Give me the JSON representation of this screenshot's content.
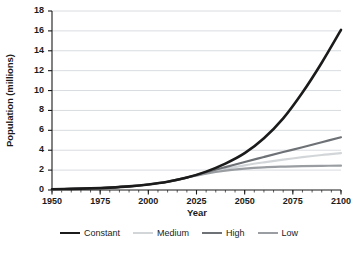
{
  "chart_data": {
    "type": "line",
    "title": "",
    "xlabel": "Year",
    "ylabel": "Population (millions)",
    "xlim": [
      1950,
      2100
    ],
    "ylim": [
      0,
      18
    ],
    "xticks": [
      1950,
      1975,
      2000,
      2025,
      2050,
      2075,
      2100
    ],
    "xtick_labels": [
      "1950",
      "1975",
      "2000",
      "2025",
      "2050",
      "2075",
      "2100"
    ],
    "x_minor_tick_step": 5,
    "yticks": [
      0,
      2,
      4,
      6,
      8,
      10,
      12,
      14,
      16,
      18
    ],
    "ytick_labels": [
      "0",
      "2",
      "4",
      "6",
      "8",
      "10",
      "12",
      "14",
      "16",
      "18"
    ],
    "grid": "horizontal",
    "grid_color": "#d8dce0",
    "legend_position": "below",
    "x": [
      1950,
      1960,
      1970,
      1980,
      1990,
      2000,
      2010,
      2020,
      2030,
      2040,
      2050,
      2060,
      2070,
      2080,
      2090,
      2100
    ],
    "series": [
      {
        "name": "Constant",
        "color": "#1b1b1b",
        "width": 2.6,
        "values": [
          0.08,
          0.11,
          0.16,
          0.24,
          0.36,
          0.55,
          0.83,
          1.25,
          1.85,
          2.65,
          3.7,
          5.2,
          7.2,
          9.8,
          12.8,
          16.1
        ]
      },
      {
        "name": "Medium",
        "color": "#d3d6d9",
        "width": 2.2,
        "values": [
          0.08,
          0.11,
          0.16,
          0.24,
          0.36,
          0.55,
          0.83,
          1.25,
          1.72,
          2.12,
          2.48,
          2.78,
          3.05,
          3.3,
          3.52,
          3.7
        ]
      },
      {
        "name": "High",
        "color": "#6e7276",
        "width": 2.2,
        "values": [
          0.08,
          0.11,
          0.16,
          0.24,
          0.36,
          0.55,
          0.83,
          1.25,
          1.78,
          2.3,
          2.82,
          3.32,
          3.82,
          4.3,
          4.8,
          5.3
        ]
      },
      {
        "name": "Low",
        "color": "#9a9ea2",
        "width": 2.2,
        "values": [
          0.08,
          0.11,
          0.16,
          0.24,
          0.36,
          0.55,
          0.83,
          1.25,
          1.65,
          1.95,
          2.15,
          2.28,
          2.35,
          2.4,
          2.43,
          2.45
        ]
      }
    ]
  },
  "axes": {
    "y_title": "Population (millions)",
    "x_title": "Year",
    "y_tick_labels": [
      "18",
      "16",
      "14",
      "12",
      "10",
      "8",
      "6",
      "4",
      "2",
      "0"
    ],
    "x_tick_labels": [
      "1950",
      "1975",
      "2000",
      "2025",
      "2050",
      "2075",
      "2100"
    ]
  },
  "legend": {
    "items": [
      {
        "label": "Constant",
        "color": "#1b1b1b",
        "thickness": "2.6px"
      },
      {
        "label": "Medium",
        "color": "#d3d6d9",
        "thickness": "2.2px"
      },
      {
        "label": "High",
        "color": "#6e7276",
        "thickness": "2.6px"
      },
      {
        "label": "Low",
        "color": "#9a9ea2",
        "thickness": "2.2px"
      }
    ]
  },
  "colors": {
    "axis": "#1b1b1b",
    "grid": "#d8dce0",
    "background": "#ffffff"
  }
}
